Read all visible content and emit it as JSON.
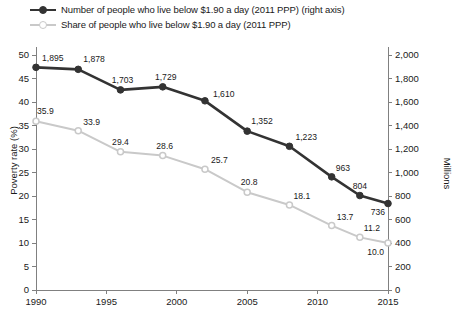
{
  "legend": {
    "items": [
      {
        "label": "Number of people who live below $1.90 a day (2011 PPP) (right axis)",
        "color": "#333333",
        "marker": "filled-circle-marker"
      },
      {
        "label": "Share of people who live below $1.90 a day (2011 PPP)",
        "color": "#c9c9c9",
        "marker": "open-circle-marker"
      }
    ]
  },
  "chart_data": {
    "type": "line",
    "title": "",
    "xlabel": "",
    "ylabel": "Poverty rate (%)",
    "y2label": "Millions",
    "xlim": [
      1990,
      2015
    ],
    "ylim": [
      0,
      50
    ],
    "y2lim": [
      0,
      2000
    ],
    "grid": false,
    "legend_position": "top-left",
    "xticks": [
      "1990",
      "1995",
      "2000",
      "2005",
      "2010",
      "2015"
    ],
    "xtick_values": [
      1990,
      1995,
      2000,
      2005,
      2010,
      2015
    ],
    "yticks": [
      "0",
      "5",
      "10",
      "15",
      "20",
      "25",
      "30",
      "35",
      "40",
      "45",
      "50"
    ],
    "ytick_values": [
      0,
      5,
      10,
      15,
      20,
      25,
      30,
      35,
      40,
      45,
      50
    ],
    "y2ticks": [
      "0",
      "200",
      "400",
      "600",
      "800",
      "1,000",
      "1,200",
      "1,400",
      "1,600",
      "1,800",
      "2,000"
    ],
    "y2tick_values": [
      0,
      200,
      400,
      600,
      800,
      1000,
      1200,
      1400,
      1600,
      1800,
      2000
    ],
    "x": [
      1990,
      1993,
      1996,
      1999,
      2002,
      2005,
      2008,
      2011,
      2013,
      2015
    ],
    "series": [
      {
        "name": "Number of people who live below $1.90 a day (2011 PPP) (right axis)",
        "axis": "right",
        "color": "#333333",
        "marker": "filled-circle-marker",
        "values": [
          1895,
          1878,
          1703,
          1729,
          1610,
          1352,
          1223,
          963,
          804,
          736
        ],
        "labels": [
          "1,895",
          "1,878",
          "1,703",
          "1,729",
          "1,610",
          "1,352",
          "1,223",
          "963",
          "804",
          "736"
        ]
      },
      {
        "name": "Share of people who live below $1.90 a day (2011 PPP)",
        "axis": "left",
        "color": "#c9c9c9",
        "marker": "open-circle-marker",
        "values": [
          35.9,
          33.9,
          29.4,
          28.6,
          25.7,
          20.8,
          18.1,
          13.7,
          11.2,
          10.0
        ],
        "labels": [
          "35.9",
          "33.9",
          "29.4",
          "28.6",
          "25.7",
          "20.8",
          "18.1",
          "13.7",
          "11.2",
          "10.0"
        ]
      }
    ]
  }
}
